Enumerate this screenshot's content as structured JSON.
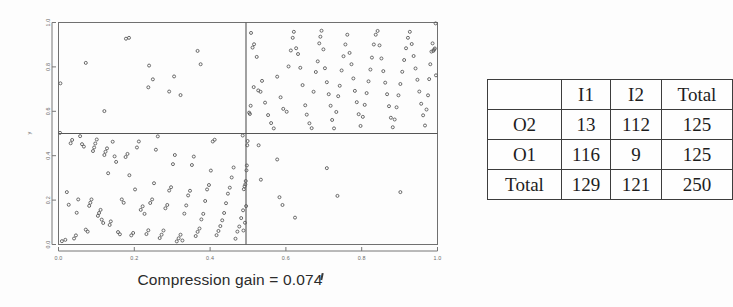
{
  "figure": {
    "xlabel": "Compression gain = 0.074",
    "ylabel": "y",
    "x_ticks": [
      "0.0",
      "0.2",
      "0.4",
      "0.6",
      "0.8",
      "1.0"
    ],
    "y_ticks": [
      "0.0",
      "0.2",
      "0.4",
      "0.6",
      "0.8",
      "1.0"
    ]
  },
  "table": {
    "corner_label": "",
    "col_headers": [
      "I1",
      "I2",
      "Total"
    ],
    "rows": [
      {
        "label": "O2",
        "cells": [
          "13",
          "112",
          "125"
        ]
      },
      {
        "label": "O1",
        "cells": [
          "116",
          "9",
          "125"
        ]
      },
      {
        "label": "Total",
        "cells": [
          "129",
          "121",
          "250"
        ]
      }
    ]
  },
  "chart_data": {
    "type": "scatter",
    "title": "",
    "xlabel": "Compression gain = 0.074",
    "ylabel": "y",
    "xlim": [
      0.0,
      1.0
    ],
    "ylim": [
      0.0,
      1.0
    ],
    "xticks": [
      0.0,
      0.2,
      0.4,
      0.6,
      0.8,
      1.0
    ],
    "yticks": [
      0.0,
      0.2,
      0.4,
      0.6,
      0.8,
      1.0
    ],
    "grid": false,
    "legend": null,
    "n_points": 250,
    "split_lines": {
      "vertical_x": 0.5,
      "horizontal_y": 0.5
    },
    "quadrant_counts": {
      "upper_left": 13,
      "upper_right": 112,
      "lower_left": 116,
      "lower_right": 9
    },
    "marker": {
      "shape": "open-circle",
      "size": 3,
      "color": "#5a5a5a"
    },
    "points": [
      [
        0.005,
        0.726
      ],
      [
        0.072,
        0.818
      ],
      [
        0.121,
        0.601
      ],
      [
        0.178,
        0.927
      ],
      [
        0.186,
        0.931
      ],
      [
        0.239,
        0.806
      ],
      [
        0.237,
        0.708
      ],
      [
        0.249,
        0.744
      ],
      [
        0.292,
        0.689
      ],
      [
        0.305,
        0.757
      ],
      [
        0.322,
        0.673
      ],
      [
        0.367,
        0.872
      ],
      [
        0.375,
        0.812
      ],
      [
        0.508,
        0.953
      ],
      [
        0.512,
        0.887
      ],
      [
        0.516,
        0.902
      ],
      [
        0.507,
        0.625
      ],
      [
        0.503,
        0.594
      ],
      [
        0.505,
        0.588
      ],
      [
        0.515,
        0.709
      ],
      [
        0.527,
        0.694
      ],
      [
        0.533,
        0.688
      ],
      [
        0.537,
        0.737
      ],
      [
        0.545,
        0.639
      ],
      [
        0.553,
        0.583
      ],
      [
        0.561,
        0.547
      ],
      [
        0.568,
        0.523
      ],
      [
        0.523,
        0.845
      ],
      [
        0.577,
        0.756
      ],
      [
        0.586,
        0.663
      ],
      [
        0.593,
        0.611
      ],
      [
        0.602,
        0.598
      ],
      [
        0.607,
        0.802
      ],
      [
        0.613,
        0.874
      ],
      [
        0.618,
        0.931
      ],
      [
        0.621,
        0.958
      ],
      [
        0.627,
        0.884
      ],
      [
        0.632,
        0.858
      ],
      [
        0.638,
        0.796
      ],
      [
        0.644,
        0.718
      ],
      [
        0.651,
        0.627
      ],
      [
        0.655,
        0.585
      ],
      [
        0.662,
        0.546
      ],
      [
        0.668,
        0.524
      ],
      [
        0.673,
        0.688
      ],
      [
        0.679,
        0.777
      ],
      [
        0.684,
        0.825
      ],
      [
        0.688,
        0.906
      ],
      [
        0.691,
        0.936
      ],
      [
        0.694,
        0.963
      ],
      [
        0.699,
        0.879
      ],
      [
        0.703,
        0.794
      ],
      [
        0.708,
        0.731
      ],
      [
        0.713,
        0.677
      ],
      [
        0.718,
        0.625
      ],
      [
        0.722,
        0.561
      ],
      [
        0.727,
        0.523
      ],
      [
        0.733,
        0.597
      ],
      [
        0.738,
        0.668
      ],
      [
        0.742,
        0.715
      ],
      [
        0.747,
        0.784
      ],
      [
        0.752,
        0.848
      ],
      [
        0.757,
        0.901
      ],
      [
        0.762,
        0.945
      ],
      [
        0.768,
        0.863
      ],
      [
        0.773,
        0.812
      ],
      [
        0.778,
        0.748
      ],
      [
        0.782,
        0.692
      ],
      [
        0.787,
        0.641
      ],
      [
        0.792,
        0.587
      ],
      [
        0.797,
        0.534
      ],
      [
        0.803,
        0.575
      ],
      [
        0.808,
        0.629
      ],
      [
        0.813,
        0.682
      ],
      [
        0.818,
        0.735
      ],
      [
        0.823,
        0.788
      ],
      [
        0.827,
        0.842
      ],
      [
        0.832,
        0.901
      ],
      [
        0.837,
        0.945
      ],
      [
        0.842,
        0.962
      ],
      [
        0.847,
        0.897
      ],
      [
        0.852,
        0.838
      ],
      [
        0.857,
        0.781
      ],
      [
        0.862,
        0.729
      ],
      [
        0.867,
        0.677
      ],
      [
        0.872,
        0.623
      ],
      [
        0.877,
        0.571
      ],
      [
        0.882,
        0.528
      ],
      [
        0.887,
        0.563
      ],
      [
        0.892,
        0.618
      ],
      [
        0.897,
        0.672
      ],
      [
        0.902,
        0.723
      ],
      [
        0.907,
        0.778
      ],
      [
        0.912,
        0.831
      ],
      [
        0.917,
        0.884
      ],
      [
        0.922,
        0.931
      ],
      [
        0.927,
        0.958
      ],
      [
        0.932,
        0.903
      ],
      [
        0.937,
        0.849
      ],
      [
        0.942,
        0.793
      ],
      [
        0.947,
        0.742
      ],
      [
        0.952,
        0.689
      ],
      [
        0.957,
        0.634
      ],
      [
        0.962,
        0.582
      ],
      [
        0.967,
        0.536
      ],
      [
        0.971,
        0.608
      ],
      [
        0.975,
        0.672
      ],
      [
        0.978,
        0.745
      ],
      [
        0.981,
        0.812
      ],
      [
        0.984,
        0.869
      ],
      [
        0.987,
        0.906
      ],
      [
        0.989,
        0.872
      ],
      [
        0.991,
        0.878
      ],
      [
        0.993,
        0.883
      ],
      [
        0.995,
        0.996
      ],
      [
        0.996,
        0.762
      ],
      [
        0.004,
        0.503
      ],
      [
        0.009,
        0.015
      ],
      [
        0.018,
        0.021
      ],
      [
        0.022,
        0.236
      ],
      [
        0.027,
        0.179
      ],
      [
        0.032,
        0.456
      ],
      [
        0.036,
        0.471
      ],
      [
        0.041,
        0.027
      ],
      [
        0.046,
        0.041
      ],
      [
        0.048,
        0.143
      ],
      [
        0.052,
        0.203
      ],
      [
        0.057,
        0.488
      ],
      [
        0.062,
        0.452
      ],
      [
        0.067,
        0.441
      ],
      [
        0.072,
        0.067
      ],
      [
        0.077,
        0.058
      ],
      [
        0.081,
        0.174
      ],
      [
        0.084,
        0.188
      ],
      [
        0.087,
        0.203
      ],
      [
        0.091,
        0.421
      ],
      [
        0.094,
        0.437
      ],
      [
        0.097,
        0.455
      ],
      [
        0.101,
        0.473
      ],
      [
        0.104,
        0.129
      ],
      [
        0.107,
        0.142
      ],
      [
        0.111,
        0.156
      ],
      [
        0.114,
        0.112
      ],
      [
        0.118,
        0.097
      ],
      [
        0.121,
        0.403
      ],
      [
        0.124,
        0.418
      ],
      [
        0.128,
        0.433
      ],
      [
        0.131,
        0.321
      ],
      [
        0.135,
        0.088
      ],
      [
        0.138,
        0.104
      ],
      [
        0.143,
        0.463
      ],
      [
        0.148,
        0.397
      ],
      [
        0.152,
        0.372
      ],
      [
        0.157,
        0.056
      ],
      [
        0.162,
        0.046
      ],
      [
        0.167,
        0.203
      ],
      [
        0.172,
        0.188
      ],
      [
        0.177,
        0.394
      ],
      [
        0.182,
        0.408
      ],
      [
        0.187,
        0.312
      ],
      [
        0.192,
        0.041
      ],
      [
        0.197,
        0.052
      ],
      [
        0.202,
        0.248
      ],
      [
        0.207,
        0.437
      ],
      [
        0.212,
        0.464
      ],
      [
        0.217,
        0.156
      ],
      [
        0.222,
        0.172
      ],
      [
        0.227,
        0.138
      ],
      [
        0.232,
        0.047
      ],
      [
        0.237,
        0.064
      ],
      [
        0.242,
        0.187
      ],
      [
        0.247,
        0.203
      ],
      [
        0.252,
        0.276
      ],
      [
        0.257,
        0.427
      ],
      [
        0.262,
        0.487
      ],
      [
        0.267,
        0.029
      ],
      [
        0.272,
        0.044
      ],
      [
        0.277,
        0.063
      ],
      [
        0.282,
        0.163
      ],
      [
        0.287,
        0.178
      ],
      [
        0.292,
        0.243
      ],
      [
        0.297,
        0.258
      ],
      [
        0.302,
        0.362
      ],
      [
        0.307,
        0.403
      ],
      [
        0.312,
        0.014
      ],
      [
        0.317,
        0.028
      ],
      [
        0.322,
        0.044
      ],
      [
        0.327,
        0.018
      ],
      [
        0.332,
        0.139
      ],
      [
        0.337,
        0.176
      ],
      [
        0.342,
        0.221
      ],
      [
        0.347,
        0.242
      ],
      [
        0.352,
        0.358
      ],
      [
        0.357,
        0.396
      ],
      [
        0.362,
        0.038
      ],
      [
        0.367,
        0.057
      ],
      [
        0.372,
        0.072
      ],
      [
        0.377,
        0.113
      ],
      [
        0.382,
        0.138
      ],
      [
        0.387,
        0.196
      ],
      [
        0.392,
        0.248
      ],
      [
        0.397,
        0.268
      ],
      [
        0.402,
        0.333
      ],
      [
        0.407,
        0.464
      ],
      [
        0.412,
        0.472
      ],
      [
        0.417,
        0.042
      ],
      [
        0.422,
        0.061
      ],
      [
        0.427,
        0.083
      ],
      [
        0.432,
        0.109
      ],
      [
        0.437,
        0.142
      ],
      [
        0.442,
        0.186
      ],
      [
        0.447,
        0.229
      ],
      [
        0.452,
        0.256
      ],
      [
        0.457,
        0.302
      ],
      [
        0.462,
        0.347
      ],
      [
        0.467,
        0.026
      ],
      [
        0.472,
        0.058
      ],
      [
        0.477,
        0.081
      ],
      [
        0.482,
        0.119
      ],
      [
        0.487,
        0.154
      ],
      [
        0.489,
        0.249
      ],
      [
        0.491,
        0.262
      ],
      [
        0.493,
        0.271
      ],
      [
        0.494,
        0.286
      ],
      [
        0.496,
        0.334
      ],
      [
        0.497,
        0.356
      ],
      [
        0.498,
        0.447
      ],
      [
        0.499,
        0.466
      ],
      [
        0.495,
        0.173
      ],
      [
        0.492,
        0.098
      ],
      [
        0.488,
        0.063
      ],
      [
        0.486,
        0.491
      ],
      [
        0.528,
        0.447
      ],
      [
        0.534,
        0.292
      ],
      [
        0.577,
        0.383
      ],
      [
        0.583,
        0.213
      ],
      [
        0.591,
        0.178
      ],
      [
        0.624,
        0.121
      ],
      [
        0.708,
        0.344
      ],
      [
        0.736,
        0.219
      ],
      [
        0.902,
        0.236
      ]
    ]
  }
}
